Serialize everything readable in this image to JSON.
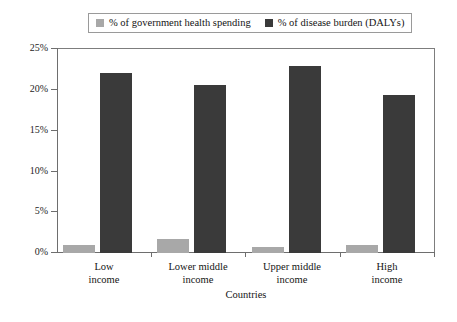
{
  "chart_data": {
    "type": "bar",
    "title": "",
    "xlabel": "Countries",
    "ylabel": "",
    "categories": [
      "Low income",
      "Lower middle income",
      "Upper middle income",
      "High income"
    ],
    "category_lines": [
      [
        "Low",
        "income"
      ],
      [
        "Lower middle",
        "income"
      ],
      [
        "Upper middle",
        "income"
      ],
      [
        "High",
        "income"
      ]
    ],
    "series": [
      {
        "name": "% of government health spending",
        "color": "#a8a8a8",
        "values": [
          1.0,
          1.7,
          0.7,
          1.0
        ]
      },
      {
        "name": "% of disease burden (DALYs)",
        "color": "#3a3a3a",
        "values": [
          21.9,
          20.5,
          22.8,
          19.3
        ]
      }
    ],
    "ylim": [
      0,
      25
    ],
    "ytick_values": [
      0,
      5,
      10,
      15,
      20,
      25
    ],
    "ytick_labels": [
      "0%",
      "5%",
      "10%",
      "15%",
      "20%",
      "25%"
    ],
    "grid": false,
    "legend_position": "top-center"
  },
  "legend": {
    "items": [
      {
        "label": "% of government health spending",
        "color": "#a8a8a8"
      },
      {
        "label": "% of disease burden (DALYs)",
        "color": "#3a3a3a"
      }
    ]
  },
  "axis": {
    "x_title": "Countries"
  }
}
